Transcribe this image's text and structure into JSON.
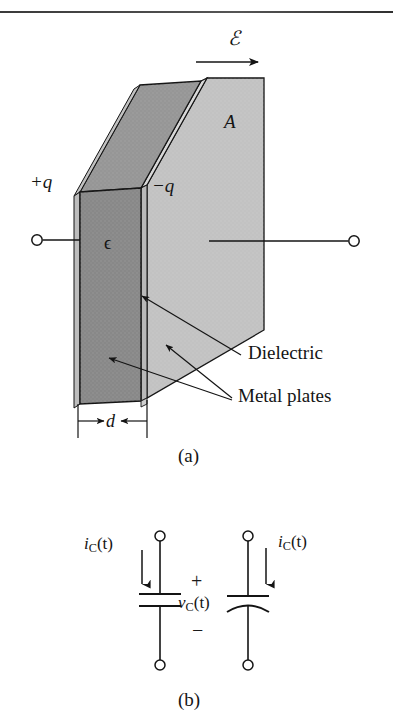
{
  "figure": {
    "title_rule": "",
    "panels": [
      {
        "id": "a",
        "caption": "(a)",
        "description": "Parallel-plate capacitor with dielectric",
        "labels": {
          "field": "ℰ",
          "area": "A",
          "charge_positive": "+q",
          "charge_negative": "−q",
          "permittivity": "ϵ",
          "separation": "d",
          "dielectric": "Dielectric",
          "metal_plates": "Metal plates"
        }
      },
      {
        "id": "b",
        "caption": "(b)",
        "description": "Capacitor circuit symbols with current and voltage",
        "labels": {
          "current_left": {
            "symbol": "i",
            "sub": "C",
            "arg": "(t)"
          },
          "current_right": {
            "symbol": "i",
            "sub": "C",
            "arg": "(t)"
          },
          "voltage": {
            "symbol": "v",
            "sub": "C",
            "arg": "(t)"
          },
          "polarity_plus": "+",
          "polarity_minus": "−"
        }
      }
    ],
    "colors": {
      "ink": "#141414",
      "dielectric_fill": "#cfcfcf",
      "plate_front_fill": "#8e8e8e",
      "plate_top_fill": "#9a9a9a",
      "plate_edge_fill": "#b5b5b5",
      "back_plate_fill": "#c8c8c8",
      "paper": "#ffffff"
    }
  }
}
